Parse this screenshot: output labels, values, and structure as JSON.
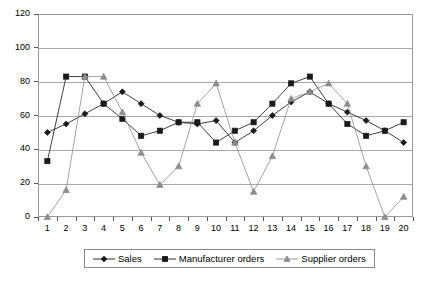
{
  "chart_data": {
    "type": "line",
    "title": "",
    "xlabel": "",
    "ylabel": "",
    "xlim": [
      1,
      20
    ],
    "ylim": [
      0,
      120
    ],
    "ytick_step": 20,
    "grid": true,
    "legend_position": "bottom",
    "categories": [
      1,
      2,
      3,
      4,
      5,
      6,
      7,
      8,
      9,
      10,
      11,
      12,
      13,
      14,
      15,
      16,
      17,
      18,
      19,
      20
    ],
    "x_tick_labels": [
      "1",
      "2",
      "3",
      "4",
      "5",
      "6",
      "7",
      "8",
      "9",
      "10",
      "11",
      "12",
      "13",
      "14",
      "15",
      "16",
      "17",
      "18",
      "19",
      "20"
    ],
    "y_tick_labels": [
      "0",
      "20",
      "40",
      "60",
      "80",
      "100",
      "120"
    ],
    "y_ticks": [
      0,
      20,
      40,
      60,
      80,
      100,
      120
    ],
    "series": [
      {
        "name": "Sales",
        "marker": "diamond",
        "color": "#1a1a1a",
        "values": [
          50,
          55,
          61,
          67,
          74,
          67,
          60,
          56,
          55,
          57,
          44,
          51,
          60,
          68,
          74,
          67,
          62,
          57,
          51,
          44
        ]
      },
      {
        "name": "Manufacturer orders",
        "marker": "square",
        "color": "#1a1a1a",
        "values": [
          33,
          83,
          83,
          67,
          58,
          48,
          51,
          56,
          56,
          44,
          51,
          56,
          67,
          79,
          83,
          67,
          55,
          48,
          51,
          56
        ]
      },
      {
        "name": "Supplier orders",
        "marker": "triangle",
        "color": "#8d8d8d",
        "values": [
          0,
          16,
          83,
          83,
          62,
          38,
          19,
          30,
          67,
          79,
          44,
          15,
          36,
          70,
          74,
          79,
          67,
          30,
          0,
          12
        ]
      }
    ]
  },
  "legend": {
    "items": [
      {
        "label": "Sales"
      },
      {
        "label": "Manufacturer orders"
      },
      {
        "label": "Supplier orders"
      }
    ]
  }
}
